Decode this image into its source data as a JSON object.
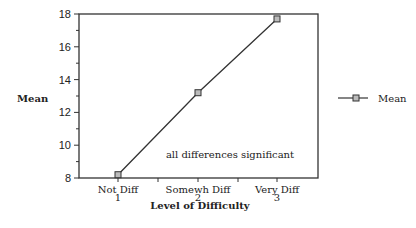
{
  "chart_data": {
    "type": "line",
    "title": "",
    "xlabel": "Level of Difficulty",
    "ylabel": "Mean",
    "ylim": [
      8,
      18
    ],
    "yticks": [
      8,
      10,
      12,
      14,
      16,
      18
    ],
    "categories": [
      "Not Diff",
      "Somewh Diff",
      "Very Diff"
    ],
    "category_numbers": [
      "1",
      "2",
      "3"
    ],
    "series": [
      {
        "name": "Mean",
        "values": [
          8.2,
          13.2,
          17.7
        ]
      }
    ],
    "annotation": "all differences significant",
    "legend": {
      "position": "right",
      "entries": [
        "Mean"
      ]
    },
    "grid": false
  }
}
